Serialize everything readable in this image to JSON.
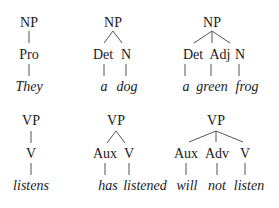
{
  "trees": [
    {
      "root": "NP",
      "children": [
        {
          "label": "Pro",
          "word": "They"
        }
      ]
    },
    {
      "root": "NP",
      "children": [
        {
          "label": "Det",
          "word": "a"
        },
        {
          "label": "N",
          "word": "dog"
        }
      ]
    },
    {
      "root": "NP",
      "children": [
        {
          "label": "Det",
          "word": "a"
        },
        {
          "label": "Adj",
          "word": "green"
        },
        {
          "label": "N",
          "word": "frog"
        }
      ]
    },
    {
      "root": "VP",
      "children": [
        {
          "label": "V",
          "word": "listens"
        }
      ]
    },
    {
      "root": "VP",
      "children": [
        {
          "label": "Aux",
          "word": "has"
        },
        {
          "label": "V",
          "word": "listened"
        }
      ]
    },
    {
      "root": "VP",
      "children": [
        {
          "label": "Aux",
          "word": "will"
        },
        {
          "label": "Adv",
          "word": "not"
        },
        {
          "label": "V",
          "word": "listen"
        }
      ]
    }
  ]
}
